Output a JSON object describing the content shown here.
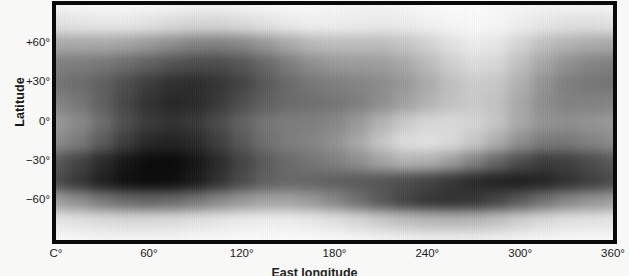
{
  "chart_data": {
    "type": "heatmap",
    "title": "",
    "subtitle": "",
    "xlabel": "East longitude",
    "ylabel": "Latitude",
    "xlim": [
      0,
      360
    ],
    "ylim": [
      -90,
      90
    ],
    "x_tick_labels": [
      "C°",
      "60°",
      "120°",
      "180°",
      "240°",
      "300°",
      "360°"
    ],
    "x_tick_values": [
      0,
      60,
      120,
      180,
      240,
      300,
      360
    ],
    "y_tick_labels": [
      "+60°",
      "+30°",
      "0°",
      "−30°",
      "−60°"
    ],
    "y_tick_values": [
      60,
      30,
      0,
      -30,
      -60
    ],
    "grid": false,
    "legend": "none",
    "colormap": "grayscale",
    "value_range": [
      0,
      1
    ],
    "frame_color": "#0a0a0a",
    "background_color": "#f8f8f6",
    "text_color": "#1b1b1b",
    "lon_grid": [
      0,
      15,
      30,
      45,
      60,
      75,
      90,
      105,
      120,
      135,
      150,
      165,
      180,
      195,
      210,
      225,
      240,
      255,
      270,
      285,
      300,
      315,
      330,
      345,
      360
    ],
    "lat_grid": [
      90,
      75,
      60,
      45,
      30,
      15,
      0,
      -15,
      -30,
      -45,
      -60,
      -75,
      -90
    ],
    "values": [
      [
        0.95,
        0.96,
        0.97,
        0.97,
        0.96,
        0.95,
        0.94,
        0.94,
        0.95,
        0.96,
        0.97,
        0.97,
        0.96,
        0.95,
        0.95,
        0.96,
        0.97,
        0.98,
        0.98,
        0.97,
        0.96,
        0.95,
        0.95,
        0.95,
        0.95
      ],
      [
        0.88,
        0.89,
        0.9,
        0.9,
        0.88,
        0.85,
        0.83,
        0.83,
        0.85,
        0.88,
        0.91,
        0.93,
        0.93,
        0.92,
        0.91,
        0.92,
        0.94,
        0.96,
        0.97,
        0.96,
        0.93,
        0.9,
        0.88,
        0.87,
        0.88
      ],
      [
        0.66,
        0.66,
        0.66,
        0.64,
        0.6,
        0.55,
        0.51,
        0.5,
        0.53,
        0.59,
        0.66,
        0.72,
        0.74,
        0.74,
        0.74,
        0.77,
        0.82,
        0.88,
        0.92,
        0.9,
        0.83,
        0.75,
        0.7,
        0.67,
        0.66
      ],
      [
        0.5,
        0.49,
        0.47,
        0.43,
        0.38,
        0.33,
        0.3,
        0.3,
        0.34,
        0.41,
        0.49,
        0.56,
        0.6,
        0.61,
        0.62,
        0.66,
        0.73,
        0.81,
        0.86,
        0.84,
        0.75,
        0.65,
        0.57,
        0.52,
        0.5
      ],
      [
        0.46,
        0.43,
        0.38,
        0.31,
        0.24,
        0.19,
        0.18,
        0.21,
        0.27,
        0.35,
        0.42,
        0.47,
        0.5,
        0.52,
        0.55,
        0.6,
        0.67,
        0.75,
        0.8,
        0.78,
        0.69,
        0.58,
        0.5,
        0.47,
        0.46
      ],
      [
        0.52,
        0.47,
        0.38,
        0.28,
        0.2,
        0.16,
        0.17,
        0.23,
        0.31,
        0.38,
        0.42,
        0.44,
        0.46,
        0.5,
        0.56,
        0.63,
        0.7,
        0.76,
        0.79,
        0.76,
        0.66,
        0.56,
        0.51,
        0.51,
        0.52
      ],
      [
        0.6,
        0.54,
        0.43,
        0.31,
        0.23,
        0.2,
        0.23,
        0.3,
        0.39,
        0.46,
        0.49,
        0.5,
        0.53,
        0.6,
        0.7,
        0.79,
        0.84,
        0.85,
        0.83,
        0.77,
        0.66,
        0.58,
        0.56,
        0.58,
        0.6
      ],
      [
        0.55,
        0.48,
        0.36,
        0.24,
        0.16,
        0.14,
        0.17,
        0.25,
        0.35,
        0.44,
        0.49,
        0.52,
        0.57,
        0.66,
        0.77,
        0.86,
        0.88,
        0.85,
        0.78,
        0.68,
        0.56,
        0.48,
        0.47,
        0.51,
        0.55
      ],
      [
        0.35,
        0.27,
        0.17,
        0.09,
        0.05,
        0.05,
        0.09,
        0.17,
        0.27,
        0.36,
        0.42,
        0.46,
        0.5,
        0.56,
        0.64,
        0.7,
        0.69,
        0.62,
        0.51,
        0.4,
        0.3,
        0.24,
        0.25,
        0.3,
        0.35
      ],
      [
        0.3,
        0.22,
        0.13,
        0.07,
        0.05,
        0.06,
        0.11,
        0.2,
        0.3,
        0.38,
        0.41,
        0.4,
        0.38,
        0.36,
        0.34,
        0.31,
        0.27,
        0.22,
        0.17,
        0.14,
        0.13,
        0.15,
        0.2,
        0.25,
        0.3
      ],
      [
        0.62,
        0.56,
        0.48,
        0.42,
        0.4,
        0.42,
        0.47,
        0.54,
        0.6,
        0.64,
        0.64,
        0.6,
        0.53,
        0.44,
        0.35,
        0.27,
        0.22,
        0.2,
        0.22,
        0.28,
        0.36,
        0.45,
        0.53,
        0.58,
        0.62
      ],
      [
        0.9,
        0.88,
        0.86,
        0.85,
        0.85,
        0.86,
        0.88,
        0.9,
        0.92,
        0.93,
        0.93,
        0.91,
        0.88,
        0.84,
        0.79,
        0.75,
        0.72,
        0.71,
        0.72,
        0.76,
        0.81,
        0.85,
        0.88,
        0.89,
        0.9
      ],
      [
        0.97,
        0.97,
        0.96,
        0.96,
        0.96,
        0.96,
        0.97,
        0.97,
        0.98,
        0.98,
        0.98,
        0.98,
        0.97,
        0.96,
        0.95,
        0.94,
        0.93,
        0.93,
        0.93,
        0.94,
        0.95,
        0.96,
        0.97,
        0.97,
        0.97
      ]
    ]
  },
  "axes": {
    "ylabel": "Latitude",
    "xlabel": "East longitude"
  }
}
